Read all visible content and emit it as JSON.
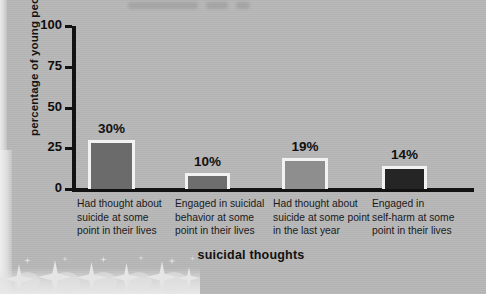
{
  "chart_data": {
    "type": "bar",
    "title": "",
    "xlabel": "suicidal thoughts",
    "ylabel": "percentage of young people",
    "ylim": [
      0,
      100
    ],
    "yticks": [
      0,
      25,
      50,
      75,
      100
    ],
    "ytick_labels": [
      "0",
      "25",
      "50",
      "75",
      "100"
    ],
    "grid": false,
    "legend": "none",
    "categories": [
      "Had thought about suicide at some point in their lives",
      "Engaged in suicidal behavior at some point in their lives",
      "Had thought about suicide at some point in the last year",
      "Engaged in self-harm at some point in their lives"
    ],
    "category_lines": [
      [
        "Had thought about",
        "suicide at some",
        "point in their lives"
      ],
      [
        "Engaged in suicidal",
        "behavior at some",
        "point in their lives"
      ],
      [
        "Had thought about",
        "suicide at some point",
        "in the last year"
      ],
      [
        "Engaged in",
        "self-harm at some",
        "point in their lives"
      ]
    ],
    "values": [
      30,
      10,
      19,
      14
    ],
    "data_labels": [
      "30%",
      "10%",
      "19%",
      "14%"
    ],
    "bar_colors": [
      "#6b6b6b",
      "#6e6e6e",
      "#8e8e8e",
      "#252525"
    ],
    "bar_border_color": "#f2f2f2"
  },
  "colors": {
    "background": "#b7b7b7",
    "axis": "#121212",
    "text": "#111111",
    "page_edge": "#e8e8e8"
  }
}
